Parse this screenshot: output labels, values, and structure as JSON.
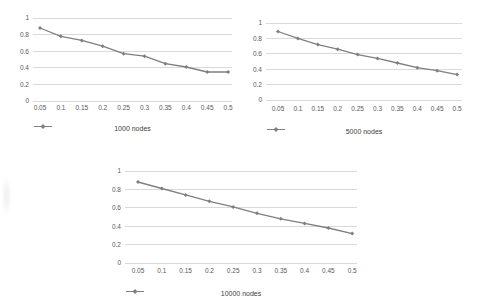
{
  "page": {
    "background": "#ffffff"
  },
  "style": {
    "line_color": "#7f7f7f",
    "marker_color": "#7f7f7f",
    "grid_color": "#d9d9d9",
    "tick_label_color": "#595959",
    "legend_text_color": "#404040"
  },
  "chart_data": [
    {
      "type": "line",
      "title": "",
      "categories": [
        "0.05",
        "0.1",
        "0.15",
        "0.2",
        "0.25",
        "0.3",
        "0.35",
        "0.4",
        "0.45",
        "0.5"
      ],
      "series": [
        {
          "name": "1000 nodes",
          "values": [
            0.88,
            0.78,
            0.73,
            0.66,
            0.57,
            0.54,
            0.45,
            0.41,
            0.35,
            0.35
          ]
        }
      ],
      "xlabel": "",
      "ylabel": "",
      "ylim": [
        0,
        1
      ],
      "y_ticks": [
        1,
        0.8,
        0.6,
        0.4,
        0.2,
        0
      ],
      "grid": true,
      "legend_position": "bottom",
      "marker": "diamond"
    },
    {
      "type": "line",
      "title": "",
      "categories": [
        "0.05",
        "0.1",
        "0.15",
        "0.2",
        "0.25",
        "0.3",
        "0.35",
        "0.4",
        "0.45",
        "0.5"
      ],
      "series": [
        {
          "name": "5000 nodes",
          "values": [
            0.89,
            0.8,
            0.72,
            0.66,
            0.59,
            0.54,
            0.48,
            0.42,
            0.38,
            0.33
          ]
        }
      ],
      "xlabel": "",
      "ylabel": "",
      "ylim": [
        0,
        1
      ],
      "y_ticks": [
        1,
        0.8,
        0.6,
        0.4,
        0.2,
        0
      ],
      "grid": true,
      "legend_position": "bottom",
      "marker": "diamond"
    },
    {
      "type": "line",
      "title": "",
      "categories": [
        "0.05",
        "0.1",
        "0.15",
        "0.2",
        "0.25",
        "0.3",
        "0.35",
        "0.4",
        "0.45",
        "0.5"
      ],
      "series": [
        {
          "name": "10000 nodes",
          "values": [
            0.88,
            0.81,
            0.74,
            0.67,
            0.61,
            0.54,
            0.48,
            0.43,
            0.38,
            0.32
          ]
        }
      ],
      "xlabel": "",
      "ylabel": "",
      "ylim": [
        0,
        1
      ],
      "y_ticks": [
        1,
        0.8,
        0.6,
        0.4,
        0.2,
        0
      ],
      "grid": true,
      "legend_position": "bottom",
      "marker": "diamond"
    }
  ]
}
